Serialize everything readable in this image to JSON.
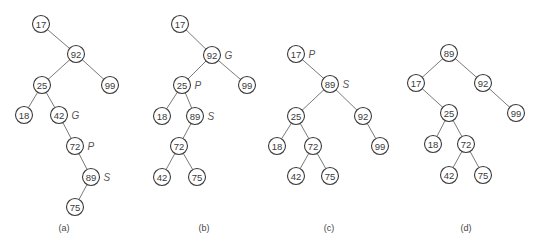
{
  "figure": {
    "node_radius": 8.5,
    "panels": [
      {
        "id": "a",
        "caption": "(a)",
        "caption_pos": [
          64,
          228
        ],
        "nodes": [
          {
            "key": "17",
            "x": 41,
            "y": 24
          },
          {
            "key": "92",
            "x": 76,
            "y": 54
          },
          {
            "key": "25",
            "x": 42,
            "y": 85
          },
          {
            "key": "99",
            "x": 110,
            "y": 85
          },
          {
            "key": "18",
            "x": 24,
            "y": 115
          },
          {
            "key": "42",
            "x": 59,
            "y": 115,
            "role": "G"
          },
          {
            "key": "72",
            "x": 75,
            "y": 146,
            "role": "P"
          },
          {
            "key": "89",
            "x": 91,
            "y": 177,
            "role": "S"
          },
          {
            "key": "75",
            "x": 75,
            "y": 207
          }
        ],
        "edges": [
          [
            "17",
            "92"
          ],
          [
            "92",
            "25"
          ],
          [
            "92",
            "99"
          ],
          [
            "25",
            "18"
          ],
          [
            "25",
            "42"
          ],
          [
            "42",
            "72"
          ],
          [
            "72",
            "89"
          ],
          [
            "89",
            "75"
          ]
        ]
      },
      {
        "id": "b",
        "caption": "(b)",
        "caption_pos": [
          204,
          228
        ],
        "nodes": [
          {
            "key": "17",
            "x": 180,
            "y": 24
          },
          {
            "key": "92",
            "x": 212,
            "y": 55,
            "role": "G"
          },
          {
            "key": "25",
            "x": 182,
            "y": 85,
            "role": "P"
          },
          {
            "key": "99",
            "x": 247,
            "y": 85
          },
          {
            "key": "18",
            "x": 162,
            "y": 116
          },
          {
            "key": "89",
            "x": 195,
            "y": 116,
            "role": "S"
          },
          {
            "key": "72",
            "x": 179,
            "y": 146
          },
          {
            "key": "42",
            "x": 162,
            "y": 177
          },
          {
            "key": "75",
            "x": 197,
            "y": 177
          }
        ],
        "edges": [
          [
            "17",
            "92"
          ],
          [
            "92",
            "25"
          ],
          [
            "92",
            "99"
          ],
          [
            "25",
            "18"
          ],
          [
            "25",
            "89"
          ],
          [
            "89",
            "72"
          ],
          [
            "72",
            "42"
          ],
          [
            "72",
            "75"
          ]
        ]
      },
      {
        "id": "c",
        "caption": "(c)",
        "caption_pos": [
          329,
          228
        ],
        "nodes": [
          {
            "key": "17",
            "x": 296,
            "y": 54,
            "role": "P"
          },
          {
            "key": "89",
            "x": 330,
            "y": 84,
            "role": "S"
          },
          {
            "key": "25",
            "x": 296,
            "y": 116
          },
          {
            "key": "92",
            "x": 363,
            "y": 116
          },
          {
            "key": "18",
            "x": 277,
            "y": 146
          },
          {
            "key": "72",
            "x": 313,
            "y": 146
          },
          {
            "key": "99",
            "x": 380,
            "y": 146
          },
          {
            "key": "42",
            "x": 296,
            "y": 176
          },
          {
            "key": "75",
            "x": 330,
            "y": 176
          }
        ],
        "edges": [
          [
            "17",
            "89"
          ],
          [
            "89",
            "25"
          ],
          [
            "89",
            "92"
          ],
          [
            "25",
            "18"
          ],
          [
            "25",
            "72"
          ],
          [
            "92",
            "99"
          ],
          [
            "72",
            "42"
          ],
          [
            "72",
            "75"
          ]
        ]
      },
      {
        "id": "d",
        "caption": "(d)",
        "caption_pos": [
          466,
          228
        ],
        "nodes": [
          {
            "key": "89",
            "x": 449,
            "y": 53
          },
          {
            "key": "17",
            "x": 416,
            "y": 83
          },
          {
            "key": "92",
            "x": 483,
            "y": 83
          },
          {
            "key": "25",
            "x": 449,
            "y": 113
          },
          {
            "key": "99",
            "x": 516,
            "y": 113
          },
          {
            "key": "18",
            "x": 433,
            "y": 144
          },
          {
            "key": "72",
            "x": 466,
            "y": 144
          },
          {
            "key": "42",
            "x": 449,
            "y": 175
          },
          {
            "key": "75",
            "x": 483,
            "y": 175
          }
        ],
        "edges": [
          [
            "89",
            "17"
          ],
          [
            "89",
            "92"
          ],
          [
            "17",
            "25"
          ],
          [
            "92",
            "99"
          ],
          [
            "25",
            "18"
          ],
          [
            "25",
            "72"
          ],
          [
            "72",
            "42"
          ],
          [
            "72",
            "75"
          ]
        ]
      }
    ]
  }
}
